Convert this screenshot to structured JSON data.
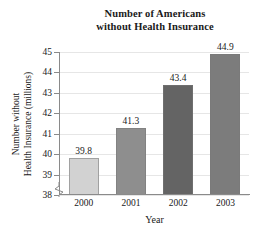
{
  "chart_data": {
    "type": "bar",
    "title": "Number of Americans without Health Insurance",
    "title_lines": [
      "Number of Americans",
      "without Health Insurance"
    ],
    "categories": [
      "2000",
      "2001",
      "2002",
      "2003"
    ],
    "values": [
      39.8,
      41.3,
      43.4,
      44.9
    ],
    "value_labels": [
      "39.8",
      "41.3",
      "43.4",
      "44.9"
    ],
    "xlabel": "Year",
    "ylabel": "Number without Health Insurance (millions)",
    "ylabel_lines": [
      "Number without",
      "Health Insurance (millions)"
    ],
    "ylim": [
      38,
      45
    ],
    "yticks": [
      45,
      44,
      43,
      42,
      41,
      40,
      39,
      38
    ],
    "ytick_labels": [
      "45",
      "44",
      "43",
      "42",
      "41",
      "40",
      "39",
      "38"
    ],
    "axis_break": true,
    "grid": "horizontal",
    "legend": "none",
    "bar_colors": [
      "#d2d2d2",
      "#8e8e8e",
      "#646464",
      "#7c7c7c"
    ],
    "grid_color": "#e6e6e6",
    "axis_color": "#8a8a8a",
    "background_color": "#ffffff"
  }
}
